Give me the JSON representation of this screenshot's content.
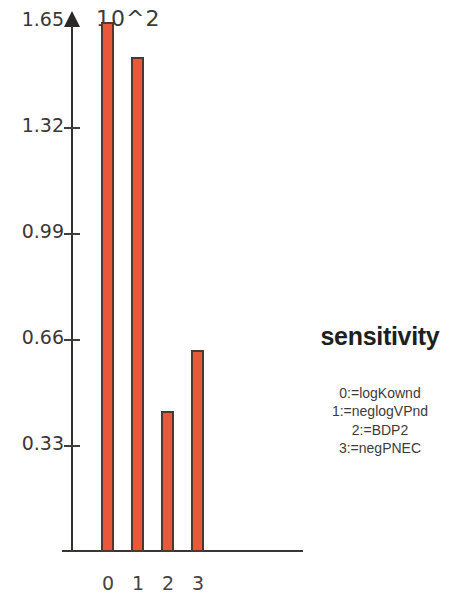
{
  "chart_data": {
    "type": "bar",
    "title": "sensitivity",
    "xlabel": "",
    "ylabel": "",
    "scale_annotation": "10^2",
    "categories": [
      "0",
      "1",
      "2",
      "3"
    ],
    "values": [
      1.65,
      1.54,
      0.44,
      0.63
    ],
    "ylim": [
      0,
      1.65
    ],
    "ytick_labels": [
      "1.65",
      "1.32",
      "0.99",
      "0.66",
      "0.33"
    ],
    "ytick_values": [
      1.65,
      1.32,
      0.99,
      0.66,
      0.33
    ],
    "xtick_labels": [
      "0",
      "1",
      "2",
      "3"
    ],
    "grid": false,
    "legend_position": "right",
    "legend_entries": [
      "0:=logKownd",
      "1:=neglogVPnd",
      "2:=BDP2",
      "3:=negPNEC"
    ],
    "bar_color": "#ea5739",
    "bar_border_color": "#53372c",
    "axis_color": "#3a3635",
    "background_color": "#ffffff"
  }
}
